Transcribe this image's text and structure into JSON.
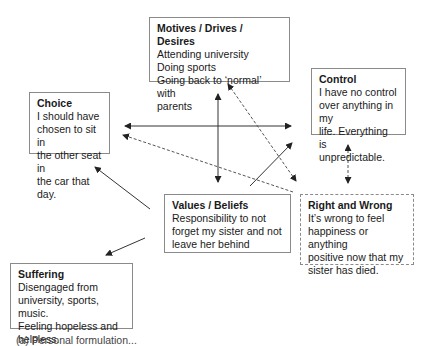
{
  "diagram": {
    "boxes": {
      "motives": {
        "title": "Motives / Drives / Desires",
        "lines": [
          "Attending university",
          "Doing sports",
          "Going back to ‘normal’ with",
          "parents"
        ]
      },
      "control": {
        "title": "Control",
        "lines": [
          "I have no control",
          "over anything in my",
          "life. Everything is",
          "unpredictable."
        ]
      },
      "choice": {
        "title": "Choice",
        "lines": [
          "I should have",
          "chosen to sit in",
          "the other seat in",
          "the car that day."
        ]
      },
      "values": {
        "title": "Values / Beliefs",
        "lines": [
          "Responsibility to not",
          "forget my sister and not",
          "leave her behind"
        ]
      },
      "right_wrong": {
        "title": "Right and Wrong",
        "lines": [
          "It’s wrong to feel",
          "happiness or anything",
          "positive now that my",
          "sister has died."
        ]
      },
      "suffering": {
        "title": "Suffering",
        "lines": [
          "Disengaged from",
          "university, sports, music.",
          "Feeling hopeless and",
          "helpless."
        ]
      }
    },
    "connections": [
      {
        "from": "motives",
        "to": "values",
        "style": "solid",
        "direction": "both"
      },
      {
        "from": "choice",
        "to": "control",
        "style": "solid",
        "direction": "both"
      },
      {
        "from": "motives",
        "to": "right_wrong",
        "style": "dashed",
        "direction": "both"
      },
      {
        "from": "right_wrong",
        "to": "choice",
        "style": "dashed",
        "direction": "forward"
      },
      {
        "from": "values",
        "to": "control",
        "style": "solid",
        "direction": "forward"
      },
      {
        "from": "values",
        "to": "choice",
        "style": "solid",
        "direction": "forward"
      },
      {
        "from": "values",
        "to": "suffering",
        "style": "solid",
        "direction": "forward"
      },
      {
        "from": "control",
        "to": "right_wrong",
        "style": "dashed",
        "direction": "both"
      }
    ],
    "caption": "(a) Personal formulation..."
  }
}
